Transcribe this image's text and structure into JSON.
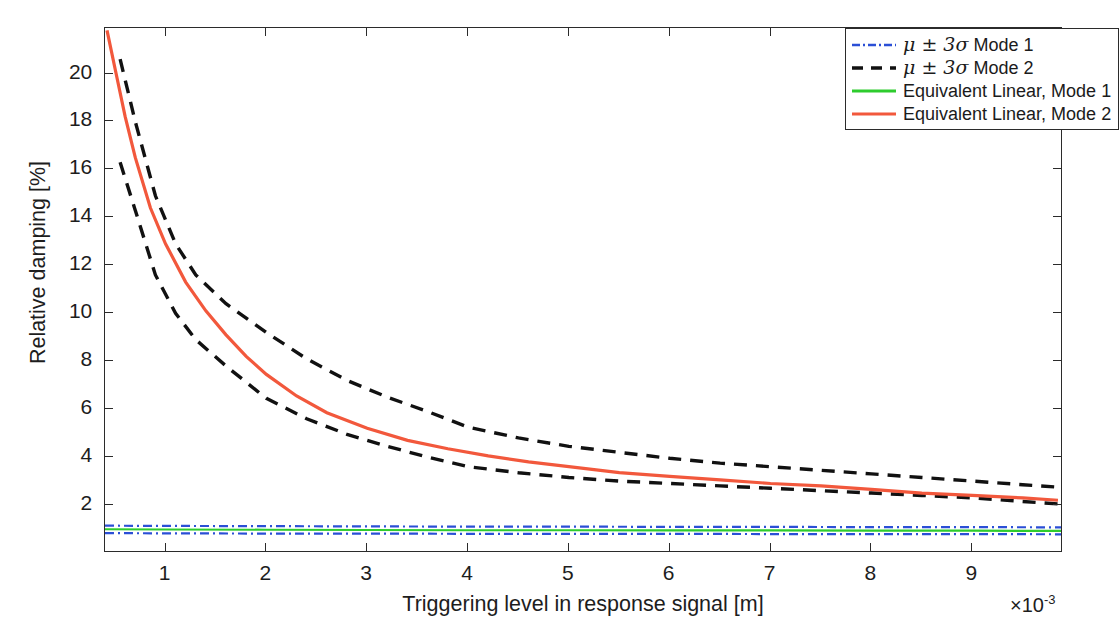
{
  "chart_data": {
    "type": "line",
    "title": "",
    "xlabel": "Triggering level in response signal [m]",
    "ylabel": "Relative damping [%]",
    "x_exponent_prefix": "×10",
    "x_exponent_power": "-3",
    "xlim": [
      0.4,
      9.9
    ],
    "ylim": [
      0.0,
      21.9
    ],
    "xticks": [
      1,
      2,
      3,
      4,
      5,
      6,
      7,
      8,
      9
    ],
    "yticks": [
      2,
      4,
      6,
      8,
      10,
      12,
      14,
      16,
      18,
      20
    ],
    "grid": false,
    "legend_position": "top-right",
    "x_unit_scale": 0.001,
    "series": [
      {
        "name": "μ + 3σ Mode 1",
        "legend_entry": "μ ± 3σ Mode 1",
        "color": "#2b4fd6",
        "style": "dashdot",
        "width": 2.2,
        "x": [
          0.4,
          1,
          2,
          3,
          4,
          5,
          6,
          7,
          8,
          9,
          9.9
        ],
        "values": [
          1.14,
          1.13,
          1.12,
          1.11,
          1.1,
          1.1,
          1.09,
          1.09,
          1.08,
          1.08,
          1.07
        ]
      },
      {
        "name": "μ - 3σ Mode 1",
        "legend_entry": "",
        "color": "#2b4fd6",
        "style": "dashdot",
        "width": 2.2,
        "x": [
          0.4,
          1,
          2,
          3,
          4,
          5,
          6,
          7,
          8,
          9,
          9.9
        ],
        "values": [
          0.83,
          0.82,
          0.81,
          0.81,
          0.8,
          0.8,
          0.8,
          0.79,
          0.79,
          0.79,
          0.78
        ]
      },
      {
        "name": "μ + 3σ Mode 2",
        "legend_entry": "μ ± 3σ Mode 2",
        "color": "#111111",
        "style": "dashed",
        "width": 3.4,
        "x": [
          0.55,
          0.7,
          0.9,
          1.1,
          1.3,
          1.6,
          2.0,
          2.4,
          2.8,
          3.2,
          3.6,
          4.0,
          4.5,
          5.0,
          5.5,
          6.0,
          6.5,
          7.0,
          7.5,
          8.0,
          8.5,
          9.0,
          9.5,
          9.85
        ],
        "values": [
          20.6,
          18.0,
          14.9,
          12.9,
          11.6,
          10.4,
          9.2,
          8.1,
          7.2,
          6.5,
          5.9,
          5.25,
          4.8,
          4.45,
          4.2,
          3.95,
          3.75,
          3.6,
          3.45,
          3.3,
          3.15,
          3.0,
          2.85,
          2.75
        ]
      },
      {
        "name": "μ - 3σ Mode 2",
        "legend_entry": "",
        "color": "#111111",
        "style": "dashed",
        "width": 3.4,
        "x": [
          0.55,
          0.7,
          0.9,
          1.1,
          1.3,
          1.6,
          2.0,
          2.4,
          2.8,
          3.2,
          3.6,
          4.0,
          4.5,
          5.0,
          5.5,
          6.0,
          6.5,
          7.0,
          7.5,
          8.0,
          8.5,
          9.0,
          9.5,
          9.85
        ],
        "values": [
          16.3,
          14.3,
          11.6,
          10.0,
          8.9,
          7.8,
          6.45,
          5.6,
          4.95,
          4.45,
          4.0,
          3.6,
          3.35,
          3.15,
          3.0,
          2.9,
          2.8,
          2.7,
          2.6,
          2.5,
          2.4,
          2.3,
          2.15,
          2.05
        ]
      },
      {
        "name": "Equivalent Linear, Mode 1",
        "legend_entry": "Equivalent Linear, Mode 1",
        "color": "#2ecc2e",
        "style": "solid",
        "width": 2.2,
        "x": [
          0.4,
          1,
          2,
          3,
          4,
          5,
          6,
          7,
          8,
          9,
          9.9
        ],
        "values": [
          0.99,
          0.98,
          0.97,
          0.96,
          0.95,
          0.95,
          0.94,
          0.94,
          0.93,
          0.93,
          0.92
        ]
      },
      {
        "name": "Equivalent Linear, Mode 2",
        "legend_entry": "Equivalent Linear, Mode 2",
        "color": "#f2583c",
        "style": "solid",
        "width": 3.2,
        "x": [
          0.42,
          0.5,
          0.6,
          0.7,
          0.85,
          1.0,
          1.2,
          1.4,
          1.6,
          1.8,
          2.0,
          2.3,
          2.6,
          3.0,
          3.4,
          3.8,
          4.2,
          4.6,
          5.0,
          5.5,
          6.0,
          6.5,
          7.0,
          7.5,
          8.0,
          8.5,
          9.0,
          9.5,
          9.85
        ],
        "values": [
          21.8,
          20.2,
          18.2,
          16.5,
          14.4,
          12.9,
          11.3,
          10.1,
          9.1,
          8.2,
          7.45,
          6.55,
          5.85,
          5.2,
          4.7,
          4.35,
          4.05,
          3.8,
          3.6,
          3.35,
          3.2,
          3.05,
          2.9,
          2.8,
          2.65,
          2.5,
          2.4,
          2.3,
          2.2
        ]
      }
    ]
  },
  "axes": {
    "y_title": "Relative damping [%]",
    "x_title": "Triggering level in response signal [m]",
    "y_tick_labels": [
      "20",
      "18",
      "16",
      "14",
      "12",
      "10",
      "8",
      "6",
      "4",
      "2"
    ],
    "x_tick_labels": [
      "1",
      "2",
      "3",
      "4",
      "5",
      "6",
      "7",
      "8",
      "9"
    ],
    "x_exponent_text": "×10",
    "x_exponent_sup": "-3"
  },
  "legend": {
    "items": [
      {
        "label_pre": "μ ± 3",
        "label_sigma": "σ",
        "label_post": " Mode 1",
        "color": "#2b4fd6",
        "style": "dashdot"
      },
      {
        "label_pre": "μ ± 3",
        "label_sigma": "σ",
        "label_post": " Mode 2",
        "color": "#111111",
        "style": "dashed"
      },
      {
        "label_pre": "",
        "label_sigma": "",
        "label_post": "Equivalent Linear, Mode 1",
        "color": "#2ecc2e",
        "style": "solid"
      },
      {
        "label_pre": "",
        "label_sigma": "",
        "label_post": "Equivalent Linear, Mode 2",
        "color": "#f2583c",
        "style": "solid"
      }
    ]
  }
}
